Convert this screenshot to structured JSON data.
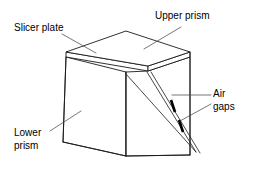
{
  "figure": {
    "type": "technical-line-diagram",
    "background_color": "#ffffff",
    "line_color": "#1a1a1a",
    "leader_color": "#4a4a4a",
    "gap_mark_color": "#000000",
    "canvas": {
      "width": 256,
      "height": 173
    }
  },
  "labels": {
    "slicer_plate": "Slicer plate",
    "upper_prism": "Upper prism",
    "air_gaps_line1": "Air",
    "air_gaps_line2": "gaps",
    "lower_prism_line1": "Lower",
    "lower_prism_line2": "prism"
  },
  "parts": [
    {
      "id": "slicer-plate",
      "name": "Slicer plate"
    },
    {
      "id": "upper-prism",
      "name": "Upper prism"
    },
    {
      "id": "lower-prism",
      "name": "Lower prism"
    },
    {
      "id": "air-gaps",
      "name": "Air gaps",
      "count": 2
    }
  ],
  "geometry": {
    "top_face": "66,52 126,31 190,52 148,66",
    "plate_front": "66,52 66,57 148,71 148,66",
    "plate_right": "148,66 148,71 190,57 190,52",
    "left_face": "66,57 126,72 126,156 63,142",
    "right_face": "126,72 148,71 190,57 190,155 126,156",
    "right_vertical_edge": "190,52 190,155",
    "front_vertical_edge": "126,72 126,156",
    "bottom_left_edge": "63,142 126,156",
    "bottom_right_edge": "126,156 190,155",
    "left_vertical_edge": "66,57 63,142",
    "diagonal_cut": "126,74 196,152",
    "air_gap_line_a": "147,72 196,152",
    "air_gap_line_b": "151,72 200,153",
    "gap_mark_1": "171,100 175,112",
    "gap_mark_2": "179,120 183,132"
  },
  "leaders": {
    "slicer_plate": "62,34 96,53",
    "upper_prism": "181,27 144,49",
    "air_gaps_upper": "211,95 172,95",
    "air_gaps_lower": "211,104 180,121",
    "lower_prism": "50,131 81,111"
  },
  "label_positions": {
    "slicer_plate": {
      "x": 14,
      "y": 31
    },
    "upper_prism": {
      "x": 155,
      "y": 19
    },
    "air_gaps_line1": {
      "x": 213,
      "y": 97
    },
    "air_gaps_line2": {
      "x": 213,
      "y": 110
    },
    "lower_prism_line1": {
      "x": 14,
      "y": 136
    },
    "lower_prism_line2": {
      "x": 14,
      "y": 149
    }
  }
}
